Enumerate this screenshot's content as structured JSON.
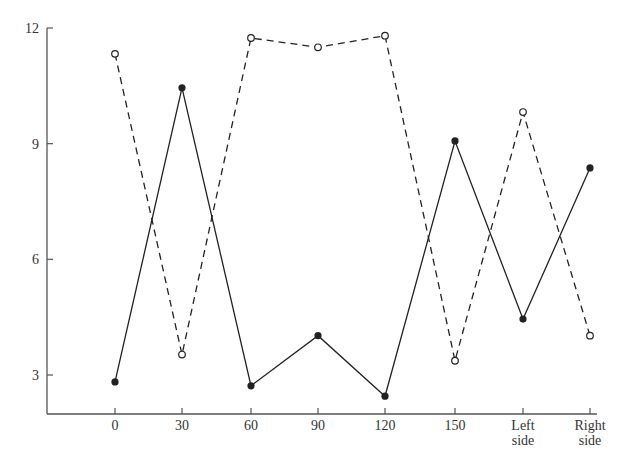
{
  "chart_data": {
    "type": "line",
    "title": "",
    "xlabel": "",
    "ylabel": "",
    "categories": [
      "0",
      "30",
      "60",
      "90",
      "120",
      "150",
      "Left side",
      "Right side"
    ],
    "yticks": [
      3,
      6,
      9,
      12
    ],
    "ylim": [
      1.0,
      12.0
    ],
    "grid": false,
    "legend": "none",
    "series": [
      {
        "name": "solid (filled markers)",
        "style": "solid",
        "marker": "filled-circle",
        "values": [
          2.82,
          10.45,
          2.72,
          4.02,
          2.45,
          9.07,
          4.45,
          8.37
        ]
      },
      {
        "name": "dashed (open markers)",
        "style": "dashed",
        "marker": "open-circle",
        "values": [
          11.33,
          3.53,
          11.74,
          11.5,
          11.8,
          3.37,
          9.82,
          4.02
        ]
      }
    ]
  },
  "axis": {
    "y_tick_labels": [
      "12",
      "9",
      "6",
      "3"
    ],
    "x_tick_labels": [
      {
        "line1": "0",
        "line2": ""
      },
      {
        "line1": "30",
        "line2": ""
      },
      {
        "line1": "60",
        "line2": ""
      },
      {
        "line1": "90",
        "line2": ""
      },
      {
        "line1": "120",
        "line2": ""
      },
      {
        "line1": "150",
        "line2": ""
      },
      {
        "line1": "Left",
        "line2": "side"
      },
      {
        "line1": "Right",
        "line2": "side"
      }
    ]
  },
  "colors": {
    "line": "#222222",
    "axis": "#555555",
    "text": "#333333"
  }
}
